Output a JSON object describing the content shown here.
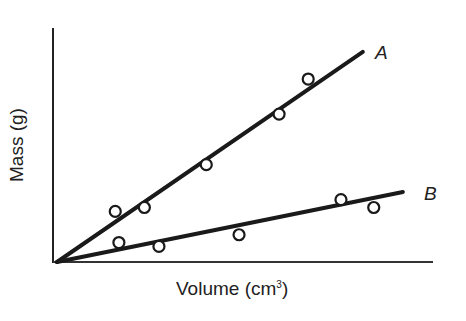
{
  "chart_data": {
    "type": "scatter",
    "title": "",
    "xlabel": "Volume (cm3)",
    "xlabel_base": "Volume (cm",
    "xlabel_sup": "3",
    "xlabel_close": ")",
    "ylabel": "Mass (g)",
    "xlim": [
      0,
      10
    ],
    "ylim": [
      0,
      6
    ],
    "grid": false,
    "ticks": false,
    "legend": "inline labels at line ends",
    "series": [
      {
        "name": "A",
        "points": [
          [
            1.6,
            1.3
          ],
          [
            2.4,
            1.4
          ],
          [
            4.1,
            2.5
          ],
          [
            6.1,
            3.8
          ],
          [
            6.9,
            4.7
          ]
        ],
        "fit_line": {
          "from": [
            0,
            0
          ],
          "to": [
            8.4,
            5.4
          ]
        }
      },
      {
        "name": "B",
        "points": [
          [
            1.7,
            0.5
          ],
          [
            2.8,
            0.4
          ],
          [
            5.0,
            0.7
          ],
          [
            7.8,
            1.6
          ],
          [
            8.7,
            1.4
          ]
        ],
        "fit_line": {
          "from": [
            0,
            0
          ],
          "to": [
            9.5,
            1.8
          ]
        }
      }
    ]
  },
  "labels": {
    "series_a": "A",
    "series_b": "B"
  }
}
